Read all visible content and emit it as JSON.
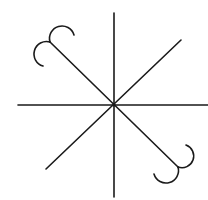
{
  "diagram": {
    "title": "",
    "stroke_color": "#1a1a1a",
    "background": "#ffffff",
    "center": [
      114,
      105
    ],
    "rays": [
      {
        "name": "vertical",
        "from": [
          114,
          13
        ],
        "to": [
          114,
          197
        ]
      },
      {
        "name": "horizontal",
        "from": [
          18,
          105
        ],
        "to": [
          208,
          105
        ]
      },
      {
        "name": "ne-sw-diagonal",
        "from": [
          181,
          40
        ],
        "to": [
          46,
          169
        ]
      },
      {
        "name": "nw-se-diagonal",
        "from": [
          50,
          42
        ],
        "to": [
          178,
          167
        ]
      }
    ],
    "curls": [
      {
        "position": "northwest",
        "arcs": 2
      },
      {
        "position": "southeast",
        "arcs": 2
      }
    ]
  }
}
